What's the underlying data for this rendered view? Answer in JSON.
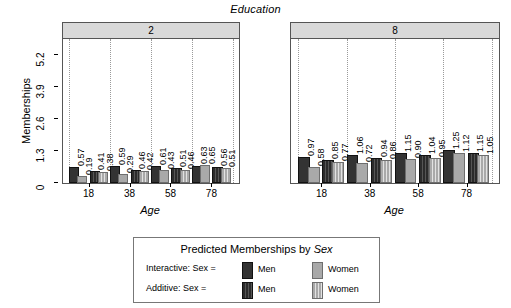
{
  "chart_data": {
    "type": "bar",
    "title": "Education",
    "xlabel": "Age",
    "ylabel": "Memberships",
    "ylim": [
      0,
      5.85
    ],
    "yticks": [
      "0",
      "1.3",
      "2.6",
      "3.9",
      "5.2"
    ],
    "ytick_values": [
      0,
      1.3,
      2.6,
      3.9,
      5.2
    ],
    "xticks": [
      "18",
      "38",
      "58",
      "78"
    ],
    "xtick_values": [
      18,
      38,
      58,
      78
    ],
    "grid": "vertical-dotted",
    "legend_position": "bottom",
    "panel_variable": "Education",
    "panels": [
      {
        "strip_label": "2",
        "groups": [
          {
            "age": "18",
            "model": "Interactive",
            "men": 0.57,
            "women": 0.19
          },
          {
            "age": "18",
            "model": "Additive",
            "men": 0.41,
            "women": 0.38
          },
          {
            "age": "38",
            "model": "Interactive",
            "men": 0.59,
            "women": 0.29
          },
          {
            "age": "38",
            "model": "Additive",
            "men": 0.46,
            "women": 0.42
          },
          {
            "age": "58",
            "model": "Interactive",
            "men": 0.61,
            "women": 0.43
          },
          {
            "age": "58",
            "model": "Additive",
            "men": 0.51,
            "women": 0.46
          },
          {
            "age": "78",
            "model": "Interactive",
            "men": 0.63,
            "women": 0.65
          },
          {
            "age": "78",
            "model": "Additive",
            "men": 0.56,
            "women": 0.51
          }
        ]
      },
      {
        "strip_label": "8",
        "groups": [
          {
            "age": "18",
            "model": "Interactive",
            "men": 0.97,
            "women": 0.58
          },
          {
            "age": "18",
            "model": "Additive",
            "men": 0.85,
            "women": 0.77
          },
          {
            "age": "38",
            "model": "Interactive",
            "men": 1.06,
            "women": 0.72
          },
          {
            "age": "38",
            "model": "Additive",
            "men": 0.94,
            "women": 0.86
          },
          {
            "age": "58",
            "model": "Interactive",
            "men": 1.15,
            "women": 0.9
          },
          {
            "age": "58",
            "model": "Additive",
            "men": 1.04,
            "women": 0.95
          },
          {
            "age": "78",
            "model": "Interactive",
            "men": 1.25,
            "women": 1.12
          },
          {
            "age": "78",
            "model": "Additive",
            "men": 1.15,
            "women": 1.05
          }
        ]
      }
    ],
    "legend": {
      "title_prefix": "Predicted Memberships by ",
      "title_emphasis": "Sex",
      "rows": [
        {
          "label": "Interactive: Sex =",
          "model": "Interactive",
          "keys": [
            {
              "text": "Men",
              "series": "men"
            },
            {
              "text": "Women",
              "series": "women"
            }
          ]
        },
        {
          "label": "Additive: Sex =",
          "model": "Additive",
          "keys": [
            {
              "text": "Men",
              "series": "men"
            },
            {
              "text": "Women",
              "series": "women"
            }
          ]
        }
      ]
    },
    "colors": {
      "men": "#333333",
      "women": "#a9a9a9",
      "strip_background": "#d9d9d9",
      "panel_border": "#555555",
      "gridline": "#9a9a9a"
    }
  }
}
